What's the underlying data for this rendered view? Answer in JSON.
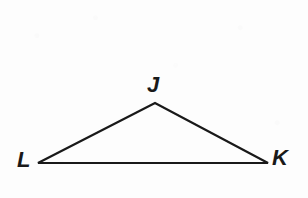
{
  "figure": {
    "kind": "geometry-diagram",
    "shape": "triangle",
    "name": "Triangle JKL",
    "canvas": {
      "width": 308,
      "height": 198
    },
    "background_color": "#fdfdfd",
    "stroke_color": "#191919",
    "stroke_width": 2,
    "label_color": "#191919"
  },
  "vertices": [
    {
      "id": "J",
      "label": "J",
      "x": 155,
      "y": 103,
      "label_x": 155,
      "label_y": 86,
      "label_position": "above"
    },
    {
      "id": "L",
      "label": "L",
      "x": 38,
      "y": 163,
      "label_x": 26,
      "label_y": 161,
      "label_position": "left"
    },
    {
      "id": "K",
      "label": "K",
      "x": 268,
      "y": 163,
      "label_x": 282,
      "label_y": 160,
      "label_position": "right"
    }
  ],
  "edges": [
    {
      "id": "LJ",
      "from": "L",
      "to": "J",
      "label": ""
    },
    {
      "id": "JK",
      "from": "J",
      "to": "K",
      "label": ""
    },
    {
      "id": "LK",
      "from": "L",
      "to": "K",
      "label": ""
    }
  ],
  "chart_data": {
    "type": "diagram",
    "title": "",
    "points": {
      "J": [
        155,
        103
      ],
      "L": [
        38,
        163
      ],
      "K": [
        268,
        163
      ]
    },
    "polygon": [
      "L",
      "J",
      "K"
    ],
    "labels": [
      "J",
      "L",
      "K"
    ],
    "closed": true
  }
}
